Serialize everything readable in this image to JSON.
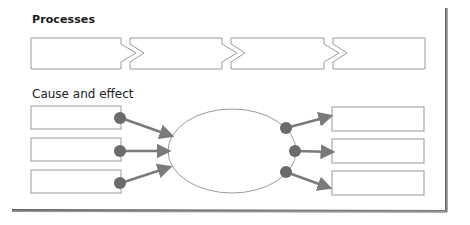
{
  "sections": {
    "processes": {
      "title": "Processes",
      "steps": [
        {
          "label": ""
        },
        {
          "label": ""
        },
        {
          "label": ""
        },
        {
          "label": ""
        }
      ]
    },
    "cause_effect": {
      "title": "Cause and effect",
      "causes": [
        {
          "label": ""
        },
        {
          "label": ""
        },
        {
          "label": ""
        }
      ],
      "center": {
        "label": ""
      },
      "effects": [
        {
          "label": ""
        },
        {
          "label": ""
        },
        {
          "label": ""
        }
      ]
    }
  },
  "colors": {
    "box_border": "#9a9a9a",
    "connector": "#7a7a7a",
    "node": "#6a6a6a",
    "shadow": "#6e6e6e"
  }
}
